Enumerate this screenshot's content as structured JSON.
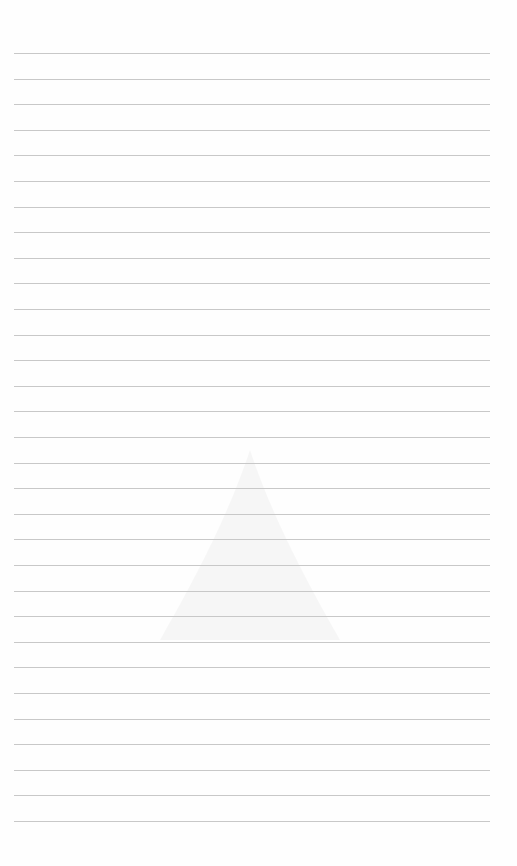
{
  "page": {
    "type": "lined-paper",
    "line_count": 31,
    "first_line_y": 53,
    "line_spacing": 25.6,
    "line_color": "#c8c8c8",
    "background": "#fefefe"
  }
}
